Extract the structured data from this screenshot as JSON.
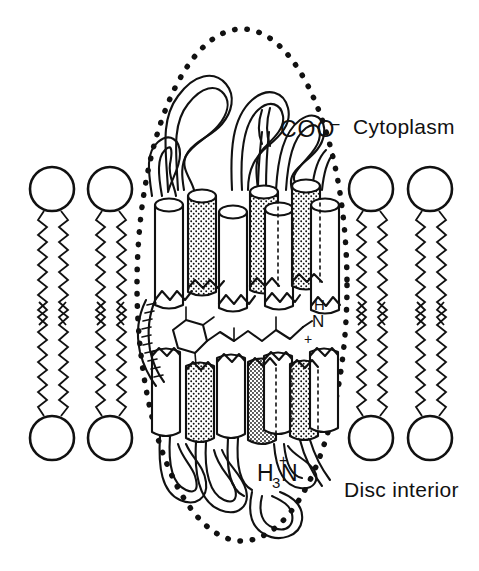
{
  "figure": {
    "kind": "schematic-diagram",
    "background_color": "#ffffff",
    "ink_color": "#111111"
  },
  "labels": {
    "cytoplasm": "Cytoplasm",
    "disc_interior": "Disc interior",
    "c_terminus_main": "COO",
    "c_terminus_charge": "–",
    "n_terminus_h": "H",
    "n_terminus_sub": "3",
    "n_terminus_n": "N",
    "n_terminus_charge": "+",
    "schiff_base_h": "H",
    "schiff_base_n": "N",
    "schiff_base_charge": "+"
  },
  "membrane": {
    "leaflets": [
      "outer",
      "inner"
    ],
    "left_lipid_count": 2,
    "right_lipid_count": 2,
    "head_group_shape": "circle",
    "tail_shape": "zigzag",
    "tails_per_lipid": 2
  },
  "protein": {
    "name": "rhodopsin",
    "transmembrane_helix_count": 7,
    "helix_shape": "cylinder",
    "shaded_helices": [
      2,
      4,
      5,
      7
    ],
    "boundary_style": "dotted-ellipse",
    "chromophore": "11-cis-retinal",
    "chromophore_ring": "beta-ionone",
    "linkage": "protonated-schiff-base"
  }
}
